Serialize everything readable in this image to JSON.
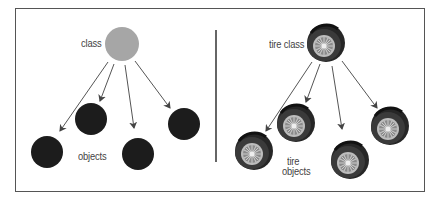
{
  "left_panel": {
    "class_label": "class",
    "objects_label": "objects",
    "class_color": "#a6a6a6",
    "object_color": "#1c1c1c"
  },
  "right_panel": {
    "class_label": "tire class",
    "objects_label_line1": "tire",
    "objects_label_line2": "objects"
  },
  "colors": {
    "frame": "#555555",
    "arrow": "#555555"
  }
}
